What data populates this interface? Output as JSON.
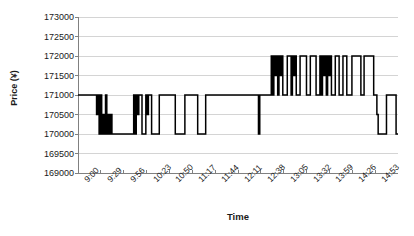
{
  "chart_data": {
    "type": "line",
    "title": "",
    "xlabel": "Time",
    "ylabel": "Price (¥)",
    "ylim": [
      169000,
      173000
    ],
    "ystep": 500,
    "yticks": [
      "173000",
      "172500",
      "172000",
      "171500",
      "171000",
      "170500",
      "170000",
      "169500",
      "169000"
    ],
    "xticks": [
      "9:00",
      "9:29",
      "9:56",
      "10:23",
      "10:50",
      "11:17",
      "11:44",
      "12:11",
      "12:38",
      "13:05",
      "13:32",
      "13:59",
      "14:26",
      "14:53"
    ],
    "grid": true,
    "grid_axis": "y",
    "legend": "none",
    "line_color": "#000000",
    "line_width": 1.5,
    "grid_color": "#c9c9c9",
    "axis_color": "#808080",
    "series": [
      {
        "name": "Price",
        "step": true,
        "points": [
          [
            0.0,
            171000
          ],
          [
            0.055,
            171000
          ],
          [
            0.058,
            170500
          ],
          [
            0.062,
            171000
          ],
          [
            0.066,
            170000
          ],
          [
            0.07,
            171000
          ],
          [
            0.074,
            170000
          ],
          [
            0.078,
            170500
          ],
          [
            0.082,
            170000
          ],
          [
            0.086,
            171000
          ],
          [
            0.09,
            170000
          ],
          [
            0.094,
            170500
          ],
          [
            0.098,
            170000
          ],
          [
            0.102,
            170500
          ],
          [
            0.106,
            170000
          ],
          [
            0.17,
            170000
          ],
          [
            0.174,
            171000
          ],
          [
            0.178,
            170000
          ],
          [
            0.182,
            171000
          ],
          [
            0.186,
            170500
          ],
          [
            0.19,
            171000
          ],
          [
            0.196,
            171000
          ],
          [
            0.2,
            170000
          ],
          [
            0.206,
            170000
          ],
          [
            0.212,
            171000
          ],
          [
            0.216,
            170500
          ],
          [
            0.22,
            171000
          ],
          [
            0.226,
            171000
          ],
          [
            0.23,
            170000
          ],
          [
            0.25,
            170000
          ],
          [
            0.254,
            171000
          ],
          [
            0.3,
            171000
          ],
          [
            0.304,
            170000
          ],
          [
            0.33,
            170000
          ],
          [
            0.334,
            171000
          ],
          [
            0.37,
            171000
          ],
          [
            0.374,
            170000
          ],
          [
            0.395,
            170000
          ],
          [
            0.399,
            171000
          ],
          [
            0.56,
            171000
          ],
          [
            0.564,
            170000
          ],
          [
            0.568,
            171000
          ],
          [
            0.6,
            171000
          ],
          [
            0.604,
            172000
          ],
          [
            0.608,
            171000
          ],
          [
            0.612,
            172000
          ],
          [
            0.616,
            171500
          ],
          [
            0.62,
            172000
          ],
          [
            0.624,
            171000
          ],
          [
            0.628,
            172000
          ],
          [
            0.632,
            171500
          ],
          [
            0.636,
            172000
          ],
          [
            0.64,
            171000
          ],
          [
            0.65,
            171000
          ],
          [
            0.654,
            172000
          ],
          [
            0.662,
            172000
          ],
          [
            0.666,
            171000
          ],
          [
            0.67,
            172000
          ],
          [
            0.674,
            171500
          ],
          [
            0.678,
            172000
          ],
          [
            0.682,
            171000
          ],
          [
            0.69,
            171000
          ],
          [
            0.694,
            172000
          ],
          [
            0.71,
            172000
          ],
          [
            0.714,
            171000
          ],
          [
            0.722,
            171000
          ],
          [
            0.726,
            172000
          ],
          [
            0.74,
            172000
          ],
          [
            0.744,
            171000
          ],
          [
            0.752,
            171000
          ],
          [
            0.756,
            172000
          ],
          [
            0.76,
            171000
          ],
          [
            0.764,
            172000
          ],
          [
            0.768,
            171500
          ],
          [
            0.772,
            172000
          ],
          [
            0.776,
            171000
          ],
          [
            0.78,
            172000
          ],
          [
            0.784,
            171500
          ],
          [
            0.788,
            172000
          ],
          [
            0.792,
            171000
          ],
          [
            0.8,
            171000
          ],
          [
            0.804,
            172000
          ],
          [
            0.812,
            172000
          ],
          [
            0.816,
            171000
          ],
          [
            0.824,
            171000
          ],
          [
            0.828,
            172000
          ],
          [
            0.836,
            172000
          ],
          [
            0.84,
            171000
          ],
          [
            0.852,
            171000
          ],
          [
            0.856,
            172000
          ],
          [
            0.88,
            172000
          ],
          [
            0.884,
            171000
          ],
          [
            0.89,
            171000
          ],
          [
            0.894,
            172000
          ],
          [
            0.92,
            172000
          ],
          [
            0.924,
            171000
          ],
          [
            0.93,
            171000
          ],
          [
            0.934,
            170500
          ],
          [
            0.938,
            170000
          ],
          [
            0.96,
            170000
          ],
          [
            0.964,
            171000
          ],
          [
            0.99,
            171000
          ],
          [
            0.994,
            170000
          ],
          [
            1.0,
            170000
          ]
        ]
      }
    ]
  },
  "axes": {
    "y_title": "Price (¥)",
    "x_title": "Time"
  }
}
